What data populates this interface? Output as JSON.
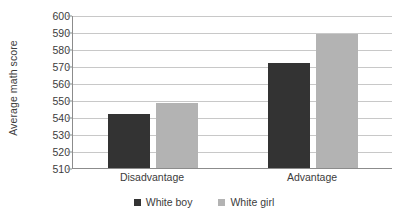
{
  "chart_data": {
    "type": "bar",
    "title": "",
    "subtitle": "",
    "xlabel": "",
    "ylabel": "Average math score",
    "categories": [
      "Disadvantage",
      "Advantage"
    ],
    "series": [
      {
        "name": "White boy",
        "color": "#333333",
        "values": [
          542,
          572
        ]
      },
      {
        "name": "White girl",
        "color": "#b3b3b3",
        "values": [
          548,
          589
        ]
      }
    ],
    "ylim": [
      510,
      600
    ],
    "ytick_step": 10,
    "yticks": [
      510,
      520,
      530,
      540,
      550,
      560,
      570,
      580,
      590,
      600
    ],
    "grid": true,
    "grid_axis": "y",
    "legend_position": "bottom-center",
    "axis_color": "#8c8c8c",
    "grid_color": "#c8c8c8",
    "background": "#ffffff"
  }
}
